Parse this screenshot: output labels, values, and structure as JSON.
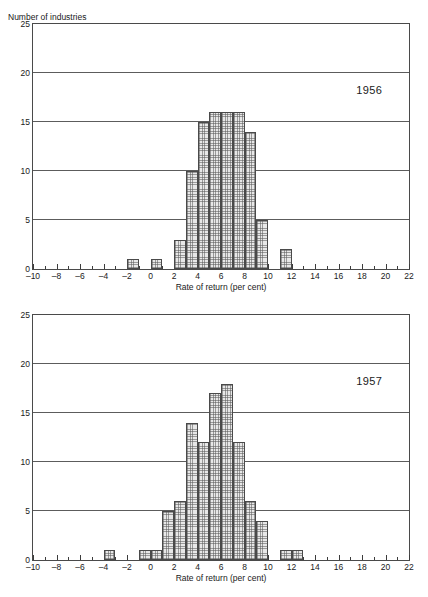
{
  "page": {
    "top_remnant_text": "· · ·"
  },
  "charts": [
    {
      "id": "chart-1956",
      "year_label": "1956",
      "ylabel": "Number of industries",
      "xlabel": "Rate of return (per cent)"
    },
    {
      "id": "chart-1957",
      "year_label": "1957",
      "ylabel": "",
      "xlabel": "Rate of return (per cent)"
    }
  ],
  "chart_data": [
    {
      "type": "bar",
      "title": "1956",
      "xlabel": "Rate of return (per cent)",
      "ylabel": "Number of industries",
      "xlim": [
        -10,
        22
      ],
      "ylim": [
        0,
        25
      ],
      "xticks": [
        -10,
        -8,
        -6,
        -4,
        -2,
        0,
        2,
        4,
        6,
        8,
        10,
        12,
        14,
        16,
        18,
        20,
        22
      ],
      "yticks": [
        0,
        5,
        10,
        15,
        20,
        25
      ],
      "gridlines_y": [
        5,
        10,
        15,
        20
      ],
      "grid": true,
      "legend": "none",
      "bin_width": 1,
      "bin_starts": [
        -2,
        0,
        2,
        3,
        4,
        5,
        6,
        7,
        8,
        9,
        11
      ],
      "values": [
        1,
        1,
        3,
        10,
        15,
        16,
        16,
        16,
        14,
        5,
        2
      ],
      "bins": [
        {
          "from": -2,
          "to": -1,
          "count": 1
        },
        {
          "from": 0,
          "to": 1,
          "count": 1
        },
        {
          "from": 2,
          "to": 3,
          "count": 3
        },
        {
          "from": 3,
          "to": 4,
          "count": 10
        },
        {
          "from": 4,
          "to": 5,
          "count": 15
        },
        {
          "from": 5,
          "to": 6,
          "count": 16
        },
        {
          "from": 6,
          "to": 7,
          "count": 16
        },
        {
          "from": 7,
          "to": 8,
          "count": 16
        },
        {
          "from": 8,
          "to": 9,
          "count": 14
        },
        {
          "from": 9,
          "to": 10,
          "count": 5
        },
        {
          "from": 11,
          "to": 12,
          "count": 2
        }
      ]
    },
    {
      "type": "bar",
      "title": "1957",
      "xlabel": "Rate of return (per cent)",
      "ylabel": "",
      "xlim": [
        -10,
        22
      ],
      "ylim": [
        0,
        25
      ],
      "xticks": [
        -10,
        -8,
        -6,
        -4,
        -2,
        0,
        2,
        4,
        6,
        8,
        10,
        12,
        14,
        16,
        18,
        20,
        22
      ],
      "yticks": [
        0,
        5,
        10,
        15,
        20,
        25
      ],
      "gridlines_y": [
        5,
        10,
        15,
        20
      ],
      "grid": true,
      "legend": "none",
      "bin_width": 1,
      "bin_starts": [
        -4,
        -1,
        0,
        1,
        2,
        3,
        4,
        5,
        6,
        7,
        8,
        9,
        11,
        12
      ],
      "values": [
        1,
        1,
        1,
        5,
        6,
        14,
        12,
        17,
        18,
        12,
        6,
        4,
        1,
        1
      ],
      "bins": [
        {
          "from": -4,
          "to": -3,
          "count": 1
        },
        {
          "from": -1,
          "to": 0,
          "count": 1
        },
        {
          "from": 0,
          "to": 1,
          "count": 1
        },
        {
          "from": 1,
          "to": 2,
          "count": 5
        },
        {
          "from": 2,
          "to": 3,
          "count": 6
        },
        {
          "from": 3,
          "to": 4,
          "count": 14
        },
        {
          "from": 4,
          "to": 5,
          "count": 12
        },
        {
          "from": 5,
          "to": 6,
          "count": 17
        },
        {
          "from": 6,
          "to": 7,
          "count": 18
        },
        {
          "from": 7,
          "to": 8,
          "count": 12
        },
        {
          "from": 8,
          "to": 9,
          "count": 6
        },
        {
          "from": 9,
          "to": 10,
          "count": 4
        },
        {
          "from": 11,
          "to": 12,
          "count": 1
        },
        {
          "from": 12,
          "to": 13,
          "count": 1
        }
      ]
    }
  ]
}
